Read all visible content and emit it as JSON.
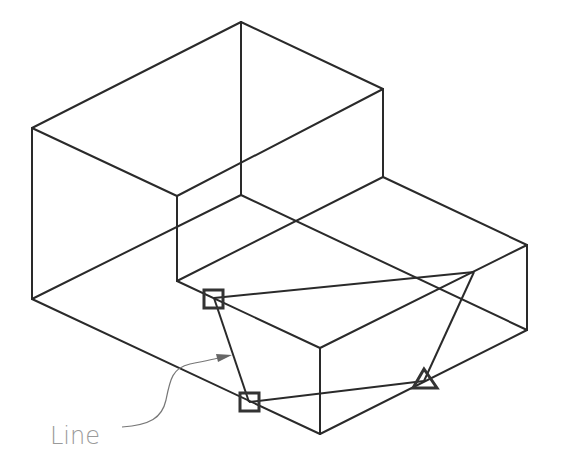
{
  "figure": {
    "type": "isometric-drawing",
    "colors": {
      "line": "#2a2a2a",
      "marker": "#333333",
      "label": "#9a9a9a",
      "background": "#ffffff"
    }
  },
  "annotation": {
    "label": "Line",
    "label_position": [
      50,
      444
    ],
    "leader_from": [
      122,
      430
    ],
    "leader_to": [
      230,
      360
    ]
  },
  "markers": [
    {
      "shape": "square",
      "name": "point-1",
      "x": 214,
      "y": 298
    },
    {
      "shape": "square",
      "name": "point-2",
      "x": 249,
      "y": 402
    },
    {
      "shape": "triangle",
      "name": "point-3",
      "x": 424,
      "y": 381
    }
  ]
}
